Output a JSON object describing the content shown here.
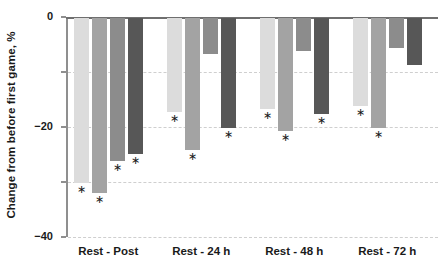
{
  "chart_data": {
    "type": "bar",
    "title": "",
    "xlabel": "",
    "ylabel": "Change from before first game, %",
    "categories": [
      "Rest - Post",
      "Rest - 24 h",
      "Rest - 48 h",
      "Rest - 72 h"
    ],
    "ylim": [
      -80,
      0
    ],
    "yticks": [
      0,
      -20,
      -40,
      -60,
      -80
    ],
    "ytick_labels": [
      "0",
      "−20",
      "−40",
      "−60",
      "−80"
    ],
    "grid": true,
    "grid_style": "dashed horizontal gridlines at -20, -40, -60, -80",
    "legend": "none",
    "annotations": "asterisk (*) below bar end marks statistically significant change",
    "series": [
      {
        "name": "Series 1",
        "color": "#dcdcdc",
        "values": [
          -60.0,
          -34.0,
          -33.0,
          -32.0
        ],
        "significant": [
          true,
          true,
          true,
          true
        ]
      },
      {
        "name": "Series 2",
        "color": "#a3a3a3",
        "values": [
          -63.5,
          -48.0,
          -41.0,
          -40.0
        ],
        "significant": [
          true,
          true,
          true,
          true
        ]
      },
      {
        "name": "Series 3",
        "color": "#8c8c8c",
        "values": [
          -52.0,
          -13.0,
          -12.0,
          -11.0
        ],
        "significant": [
          true,
          false,
          false,
          false
        ]
      },
      {
        "name": "Series 4",
        "color": "#575757",
        "values": [
          -49.5,
          -40.0,
          -35.0,
          -17.0
        ],
        "significant": [
          true,
          true,
          true,
          false
        ]
      }
    ]
  },
  "axis": {
    "y_title": "Change from before first game, %"
  },
  "marker": {
    "significance_glyph": "∗"
  }
}
